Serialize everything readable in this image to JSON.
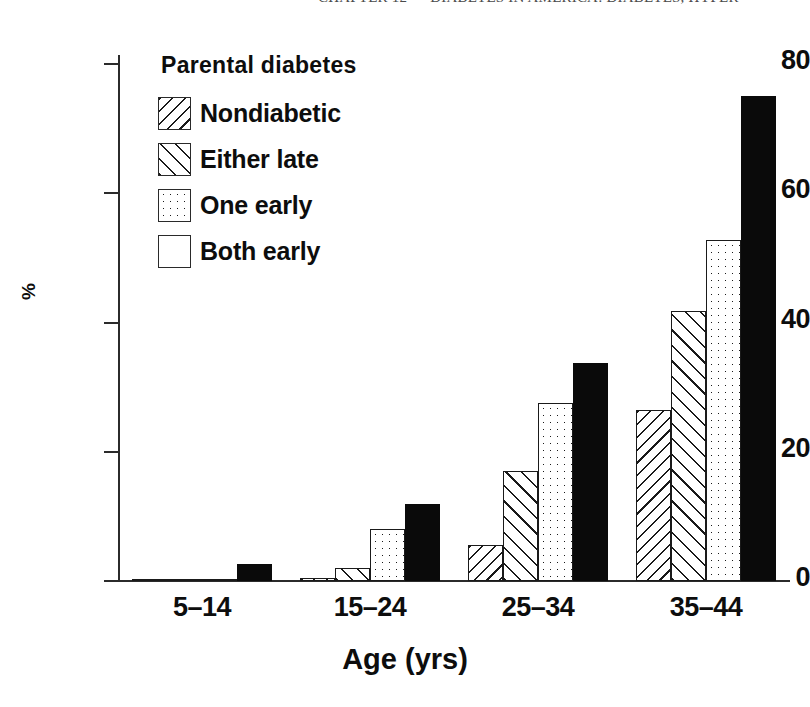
{
  "page_header": {
    "text": "CHAPTER 12  —  DIABETES IN AMERICA:  DIABETES, HYPER"
  },
  "chart_data": {
    "type": "bar",
    "title": "",
    "xlabel": "Age (yrs)",
    "ylabel": "%",
    "ylim": [
      0,
      85
    ],
    "yticks": [
      0,
      20,
      40,
      60,
      80
    ],
    "ytick_labels": [
      "0",
      "20",
      "40",
      "60",
      "80"
    ],
    "grid": false,
    "legend_position": "upper-left",
    "legend_title": "Parental diabetes",
    "categories": [
      "5–14",
      "15–24",
      "25–34",
      "35–44"
    ],
    "series": [
      {
        "name": "Nondiabetic",
        "pattern": "backslash-hatch",
        "color": "#ffffff",
        "values": [
          0.2,
          0.4,
          5.5,
          26.5
        ]
      },
      {
        "name": "Either late",
        "pattern": "slash-hatch",
        "color": "#ffffff",
        "values": [
          0.2,
          2.0,
          17.0,
          41.8
        ]
      },
      {
        "name": "One early",
        "pattern": "dotted",
        "color": "#ffffff",
        "values": [
          0.2,
          8.0,
          27.5,
          52.7
        ]
      },
      {
        "name": "Both early",
        "pattern": "solid",
        "color": "#0a0a0a",
        "values": [
          2.6,
          11.9,
          33.7,
          75.0
        ]
      }
    ]
  }
}
